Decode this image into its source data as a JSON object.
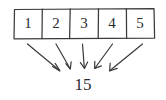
{
  "diagram": {
    "style": "hand-drawn pencil sketch on white paper",
    "stroke_color": "#3a3a3a",
    "background_color": "#ffffff",
    "array": {
      "name": "array-box",
      "cell_count": 5,
      "cells": [
        {
          "index": 0,
          "value": "1"
        },
        {
          "index": 1,
          "value": "2"
        },
        {
          "index": 2,
          "value": "3"
        },
        {
          "index": 3,
          "value": "4"
        },
        {
          "index": 4,
          "value": "5"
        }
      ]
    },
    "arrows": {
      "count": 5,
      "direction": "converging downward toward the sum",
      "items": [
        {
          "index": 0,
          "from_cell": "1",
          "x1": 27,
          "y1": 43,
          "x2": 59,
          "y2": 70
        },
        {
          "index": 1,
          "from_cell": "2",
          "x1": 55,
          "y1": 43,
          "x2": 70,
          "y2": 68
        },
        {
          "index": 2,
          "from_cell": "3",
          "x1": 82,
          "y1": 43,
          "x2": 84,
          "y2": 68
        },
        {
          "index": 3,
          "from_cell": "4",
          "x1": 112,
          "y1": 43,
          "x2": 95,
          "y2": 68
        },
        {
          "index": 4,
          "from_cell": "5",
          "x1": 142,
          "y1": 43,
          "x2": 110,
          "y2": 70
        }
      ]
    },
    "sum": {
      "name": "sum-value",
      "value": "15"
    }
  }
}
